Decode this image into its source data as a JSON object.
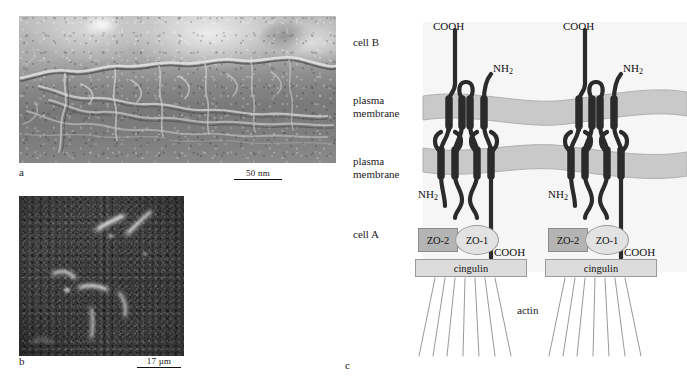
{
  "figure": {
    "panels": [
      {
        "id": "a",
        "label": "a",
        "type": "freeze-fracture-electron-micrograph",
        "caption_text": "",
        "scalebar": {
          "text": "50 nm"
        }
      },
      {
        "id": "b",
        "label": "b",
        "type": "immunofluorescence-micrograph",
        "caption_text": "",
        "scalebar": {
          "text": "17 µm"
        }
      },
      {
        "id": "c",
        "label": "c",
        "type": "schematic-diagram",
        "caption_text": ""
      }
    ]
  },
  "diagram": {
    "side_labels": {
      "cell_b": "cell B",
      "plasma_membrane_upper": "plasma\nmembrane",
      "plasma_membrane_lower": "plasma\nmembrane",
      "cell_a": "cell A"
    },
    "termini": {
      "cooh": "COOH",
      "nh2_text": "NH",
      "nh2_sub": "2"
    },
    "complexes": [
      {
        "name": "left-complex",
        "cooh_top": "COOH",
        "nh2_top": "NH",
        "nh2_top_sub": "2",
        "nh2_bottom": "NH",
        "nh2_bottom_sub": "2",
        "cooh_bottom": "COOH",
        "zo2": "ZO-2",
        "zo1": "ZO-1",
        "cingulin": "cingulin"
      },
      {
        "name": "right-complex",
        "cooh_top": "COOH",
        "nh2_top": "NH",
        "nh2_top_sub": "2",
        "nh2_bottom": "NH",
        "nh2_bottom_sub": "2",
        "cooh_bottom": "COOH",
        "zo2": "ZO-2",
        "zo1": "ZO-1",
        "cingulin": "cingulin"
      }
    ],
    "cytoskeleton": {
      "label": "actin"
    },
    "colors": {
      "membrane_fill": "#c9c9c9",
      "membrane_stroke": "#b0b0b0",
      "protein_stroke": "#2b2b2b",
      "zo2_fill": "#b4b4b4",
      "zo1_fill": "#e2e2e2",
      "cingulin_fill": "#dcdcdc",
      "actin_stroke": "#8d8d8d",
      "cytoplasm_tint": "#f2f2f2"
    }
  }
}
